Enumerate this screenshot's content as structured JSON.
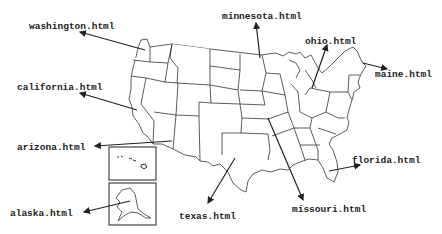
{
  "diagram": {
    "labels": [
      {
        "id": "washington",
        "text": "washington.html",
        "x": 29,
        "y": 21
      },
      {
        "id": "minnesota",
        "text": "minnesota.html",
        "x": 222,
        "y": 11
      },
      {
        "id": "ohio",
        "text": "ohio.html",
        "x": 305,
        "y": 36
      },
      {
        "id": "maine",
        "text": "maine.html",
        "x": 375,
        "y": 69
      },
      {
        "id": "california",
        "text": "california.html",
        "x": 17,
        "y": 82
      },
      {
        "id": "arizona",
        "text": "arizona.html",
        "x": 17,
        "y": 142
      },
      {
        "id": "florida",
        "text": "florida.html",
        "x": 352,
        "y": 155
      },
      {
        "id": "missouri",
        "text": "missouri.html",
        "x": 292,
        "y": 204
      },
      {
        "id": "alaska",
        "text": "alaska.html",
        "x": 10,
        "y": 208
      },
      {
        "id": "texas",
        "text": "texas.html",
        "x": 179,
        "y": 211
      }
    ],
    "insets": [
      "hawaii",
      "alaska"
    ],
    "colors": {
      "line": "#333333",
      "background": "#ffffff",
      "text": "#222222"
    }
  }
}
